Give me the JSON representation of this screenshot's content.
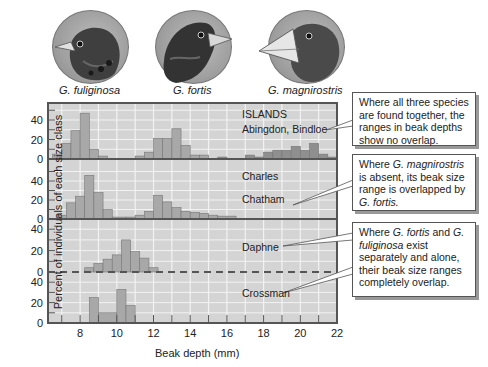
{
  "species": [
    {
      "name": "G. fuliginosa",
      "beak": "small"
    },
    {
      "name": "G. fortis",
      "beak": "medium"
    },
    {
      "name": "G. magnirostris",
      "beak": "large"
    }
  ],
  "axes": {
    "ylabel": "Percent of individuals of each size class",
    "xlabel": "Beak depth (mm)",
    "xticks": [
      "8",
      "10",
      "12",
      "14",
      "16",
      "18",
      "20",
      "22"
    ],
    "yticks": [
      "0",
      "20",
      "40"
    ]
  },
  "panels": [
    {
      "header": "ISLANDS",
      "islands": [
        "Abingdon, Bindloe"
      ]
    },
    {
      "islands": [
        "Charles",
        "Chatham"
      ]
    },
    {
      "islands": [
        "Daphne"
      ]
    },
    {
      "islands": [
        "Crossman"
      ]
    }
  ],
  "callouts": [
    {
      "parts": [
        {
          "t": "Where all three species are found together, the ranges in beak depths show no overlap."
        }
      ]
    },
    {
      "parts": [
        {
          "t": "Where "
        },
        {
          "t": "G. magnirostris",
          "i": true
        },
        {
          "t": " is absent, its beak size range is overlapped by "
        },
        {
          "t": "G. fortis.",
          "i": true
        }
      ]
    },
    {
      "parts": [
        {
          "t": "Where "
        },
        {
          "t": "G. fortis",
          "i": true
        },
        {
          "t": " and "
        },
        {
          "t": "G. fuliginosa",
          "i": true
        },
        {
          "t": " exist separately and alone, their beak size ranges completely overlap."
        }
      ]
    }
  ],
  "colors": {
    "panel_bg": "#d4d4d4",
    "grid": "#f2f2f2",
    "bar": "#a8a8a8",
    "bar_dark": "#8f8f8f",
    "frame": "#555555"
  },
  "chart_data": {
    "type": "bar",
    "title": "",
    "xlabel": "Beak depth (mm)",
    "ylabel": "Percent of individuals of each size class",
    "xlim": [
      6.25,
      22
    ],
    "ylim": [
      0,
      50
    ],
    "bin_width_mm": 0.5,
    "panels": [
      {
        "island": "Abingdon, Bindloe",
        "series": [
          {
            "name": "G. fuliginosa",
            "bins": [
              [
                6.5,
                7,
                5
              ],
              [
                7,
                7.5,
                16
              ],
              [
                7.5,
                8,
                29
              ],
              [
                8,
                8.5,
                47
              ],
              [
                8.5,
                9,
                10
              ],
              [
                9,
                9.5,
                3
              ]
            ]
          },
          {
            "name": "G. fortis",
            "bins": [
              [
                11,
                11.5,
                3
              ],
              [
                11.5,
                12,
                7
              ],
              [
                12,
                12.5,
                21
              ],
              [
                12.5,
                13,
                21
              ],
              [
                13,
                13.5,
                31
              ],
              [
                13.5,
                14,
                14
              ],
              [
                14,
                14.5,
                4
              ],
              [
                14.5,
                15,
                4
              ]
            ]
          },
          {
            "name": "G. magnirostris",
            "bins": [
              [
                15.5,
                16,
                2
              ],
              [
                17,
                17.5,
                4
              ],
              [
                17.5,
                18,
                2
              ],
              [
                18,
                18.5,
                7
              ],
              [
                18.5,
                19,
                9
              ],
              [
                19,
                19.5,
                9
              ],
              [
                19.5,
                20,
                13
              ],
              [
                20,
                20.5,
                9
              ],
              [
                20.5,
                21,
                16
              ],
              [
                21,
                21.5,
                5
              ],
              [
                21.5,
                22,
                2
              ]
            ]
          }
        ]
      },
      {
        "island": "Charles, Chatham",
        "series": [
          {
            "name": "G. fuliginosa",
            "bins": [
              [
                6.75,
                7.25,
                4
              ],
              [
                7.25,
                7.75,
                17
              ],
              [
                7.75,
                8.25,
                24
              ],
              [
                8.25,
                8.75,
                46
              ],
              [
                8.75,
                9.25,
                28
              ],
              [
                9.25,
                9.75,
                10
              ]
            ]
          },
          {
            "name": "G. fortis",
            "bins": [
              [
                9.75,
                10.5,
                2
              ],
              [
                10.5,
                11,
                2
              ],
              [
                11,
                11.5,
                4
              ],
              [
                11.5,
                12,
                8
              ],
              [
                12,
                12.5,
                25
              ],
              [
                12.5,
                13,
                18
              ],
              [
                13,
                13.5,
                12
              ],
              [
                13.5,
                14,
                8
              ],
              [
                14,
                14.5,
                7
              ],
              [
                14.5,
                15,
                6
              ],
              [
                15,
                15.5,
                4
              ],
              [
                15.5,
                16.5,
                3
              ]
            ]
          }
        ]
      },
      {
        "island": "Daphne",
        "series": [
          {
            "name": "G. fortis",
            "bins": [
              [
                8.25,
                8.75,
                4
              ],
              [
                8.75,
                9.25,
                8
              ],
              [
                9.25,
                9.75,
                12
              ],
              [
                9.75,
                10.25,
                16
              ],
              [
                10.25,
                10.75,
                30
              ],
              [
                10.75,
                11.25,
                19
              ],
              [
                11.25,
                11.75,
                13
              ],
              [
                11.75,
                12.25,
                4
              ]
            ]
          }
        ]
      },
      {
        "island": "Crossman",
        "series": [
          {
            "name": "G. fuliginosa",
            "bins": [
              [
                8.5,
                9,
                25
              ],
              [
                9,
                10,
                10
              ],
              [
                10,
                10.5,
                33
              ],
              [
                10.5,
                11,
                17
              ]
            ]
          }
        ]
      }
    ]
  }
}
